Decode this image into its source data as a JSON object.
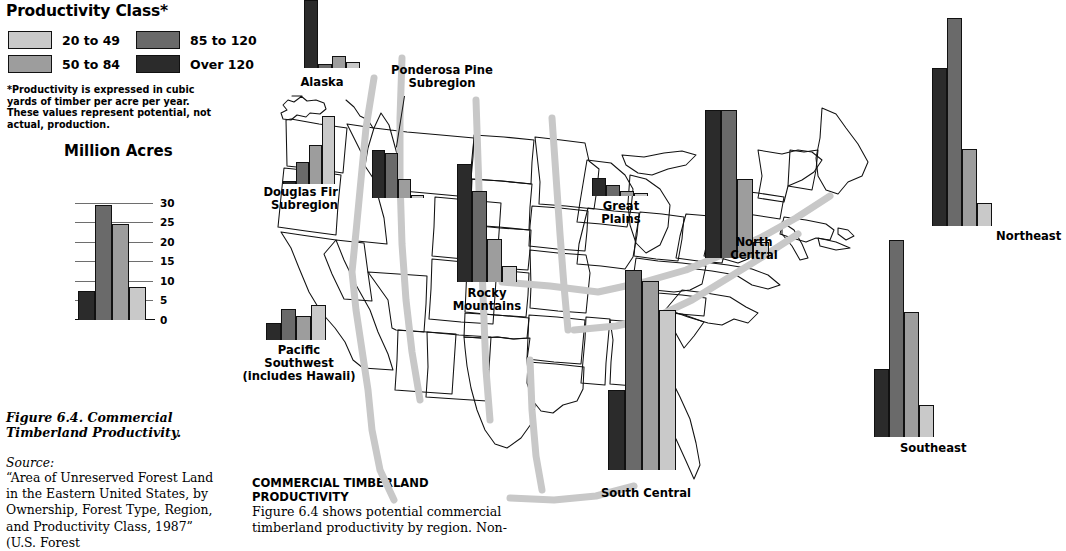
{
  "legend": {
    "title": "Productivity Class*",
    "classes": [
      {
        "label": "20 to 49",
        "color": "#c9c9c9"
      },
      {
        "label": "50 to 84",
        "color": "#9d9d9d"
      },
      {
        "label": "85 to 120",
        "color": "#6a6a6a"
      },
      {
        "label": "Over 120",
        "color": "#2b2b2b"
      }
    ],
    "note": "*Productivity is expressed in cubic yards of timber per acre per year. These values represent potential, not actual, production."
  },
  "scale": {
    "title": "Million Acres",
    "ticks": [
      "30",
      "25",
      "20",
      "15",
      "10",
      "5",
      "0"
    ],
    "tick_values": [
      30,
      25,
      20,
      15,
      10,
      5,
      0
    ],
    "ymax": 32,
    "bars": [
      {
        "class": "Over 120",
        "value": 7.5,
        "color": "#2b2b2b"
      },
      {
        "class": "85 to 120",
        "value": 29.5,
        "color": "#6a6a6a"
      },
      {
        "class": "50 to 84",
        "value": 24.5,
        "color": "#9d9d9d"
      },
      {
        "class": "20 to 49",
        "value": 8.5,
        "color": "#c9c9c9"
      }
    ]
  },
  "caption": {
    "figure": "Figure 6.4.  Commercial Timberland Productivity.",
    "source_label": "Source:",
    "source_body": "“Area of Unreserved Forest Land in the Eastern United States, by Ownership, Forest Type, Region, and Productivity Class, 1987” (U.S. Forest"
  },
  "body": {
    "heading": "COMMERCIAL TIMBERLAND PRODUCTIVITY",
    "text": "Figure 6.4 shows potential commercial timberland productivity by region. Non-"
  },
  "chart_data": {
    "type": "bar",
    "title": "Commercial Timberland Productivity",
    "ylabel": "Million Acres",
    "ylim": [
      0,
      32
    ],
    "grid": true,
    "legend_position": "top-left",
    "categories": [
      "Over 120",
      "85 to 120",
      "50 to 84",
      "20 to 49"
    ],
    "series": [
      {
        "name": "Alaska",
        "values": [
          1.5,
          3.0,
          1.0,
          17.0
        ]
      },
      {
        "name": "Douglas Fir Subregion",
        "values": [
          14.0,
          8.0,
          4.5,
          0.3
        ]
      },
      {
        "name": "Ponderosa Pine Subregion",
        "values": [
          0.4,
          3.0,
          7.0,
          7.5
        ]
      },
      {
        "name": "Pacific Southwest (includes Hawaii)",
        "values": [
          5.0,
          3.5,
          4.5,
          2.5
        ]
      },
      {
        "name": "Rocky Mountains",
        "values": [
          3.0,
          8.0,
          17.0,
          22.0
        ]
      },
      {
        "name": "Great Plains",
        "values": [
          0.2,
          0.7,
          1.6,
          2.6
        ]
      },
      {
        "name": "North Central",
        "values": [
          3.0,
          15.0,
          28.0,
          28.0
        ]
      },
      {
        "name": "South Central",
        "values": [
          22.0,
          26.0,
          27.5,
          11.0
        ]
      },
      {
        "name": "Southeast",
        "values": [
          4.0,
          15.5,
          24.5,
          8.5
        ]
      },
      {
        "name": "Northeast",
        "values": [
          3.0,
          10.0,
          27.0,
          20.5
        ]
      }
    ]
  },
  "regions": [
    {
      "name": "Alaska",
      "label": "Alaska",
      "values": [
        1.5,
        3.0,
        1.0,
        17.0
      ]
    },
    {
      "name": "Douglas Fir Subregion",
      "label": "Douglas Fir\nSubregion",
      "values": [
        14.0,
        8.0,
        4.5,
        0.3
      ]
    },
    {
      "name": "Ponderosa Pine Subregion",
      "label": "Ponderosa Pine\nSubregion",
      "values": [
        0.4,
        3.0,
        7.0,
        7.5
      ]
    },
    {
      "name": "Pacific Southwest",
      "label": "Pacific\nSouthwest\n(includes Hawaii)",
      "values": [
        5.0,
        3.5,
        4.5,
        2.5
      ]
    },
    {
      "name": "Rocky Mountains",
      "label": "Rocky\nMountains",
      "values": [
        3.0,
        8.0,
        17.0,
        22.0
      ]
    },
    {
      "name": "Great Plains",
      "label": "Great\nPlains",
      "values": [
        0.2,
        0.7,
        1.6,
        2.6
      ]
    },
    {
      "name": "North Central",
      "label": "North\nCentral",
      "values": [
        3.0,
        15.0,
        28.0,
        28.0
      ]
    },
    {
      "name": "South Central",
      "label": "South Central",
      "values": [
        22.0,
        26.0,
        27.5,
        11.0
      ]
    },
    {
      "name": "Southeast",
      "label": "Southeast",
      "values": [
        4.0,
        15.5,
        24.5,
        8.5
      ]
    },
    {
      "name": "Northeast",
      "label": "Northeast",
      "values": [
        3.0,
        10.0,
        27.0,
        20.5
      ]
    }
  ]
}
